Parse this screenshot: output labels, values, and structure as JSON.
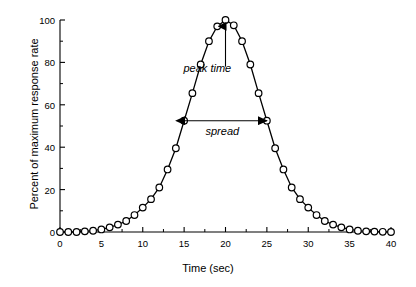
{
  "chart_data": {
    "type": "line",
    "title": "",
    "xlabel": "Time (sec)",
    "ylabel": "Percent of maximum response rate",
    "xlim": [
      0,
      40
    ],
    "ylim": [
      0,
      100
    ],
    "xticks": [
      0,
      5,
      10,
      15,
      20,
      25,
      30,
      35,
      40
    ],
    "xtick_labels": [
      "0",
      "5",
      "10",
      "15",
      "20",
      "25",
      "30",
      "35",
      "40"
    ],
    "yticks": [
      0,
      20,
      40,
      60,
      80,
      100
    ],
    "ytick_labels": [
      "0",
      "20",
      "40",
      "60",
      "80",
      "100"
    ],
    "minor_ticks": true,
    "grid": false,
    "legend": false,
    "marker": "open-circle",
    "line_color": "#000000",
    "marker_face_color": "#ffffff",
    "marker_edge_color": "#000000",
    "x": [
      0,
      1,
      2,
      3,
      4,
      5,
      6,
      7,
      8,
      9,
      10,
      11,
      12,
      13,
      14,
      15,
      16,
      17,
      18,
      19,
      20,
      21,
      22,
      23,
      24,
      25,
      26,
      27,
      28,
      29,
      30,
      31,
      32,
      33,
      34,
      35,
      36,
      37,
      38,
      39,
      40
    ],
    "values": [
      0,
      0,
      0,
      0.3,
      0.6,
      1.2,
      2.2,
      3.5,
      5.2,
      8.0,
      11.5,
      15.5,
      21.0,
      29.5,
      39.5,
      52.5,
      65.5,
      79.0,
      90.0,
      97.0,
      100.0,
      97.5,
      90.0,
      79.0,
      65.5,
      52.5,
      39.5,
      29.5,
      21.0,
      15.5,
      11.5,
      8.0,
      5.2,
      3.5,
      2.2,
      1.2,
      0.6,
      0.3,
      0.2,
      0.1,
      0.0
    ],
    "annotations": [
      {
        "name": "peak-time",
        "label": "peak time",
        "style": "arrow-up",
        "x": 20,
        "y_from": 78,
        "y_to": 97
      },
      {
        "name": "spread",
        "label": "spread",
        "style": "double-arrow-horizontal",
        "x_from": 15,
        "x_to": 25,
        "y": 52.5
      }
    ]
  }
}
